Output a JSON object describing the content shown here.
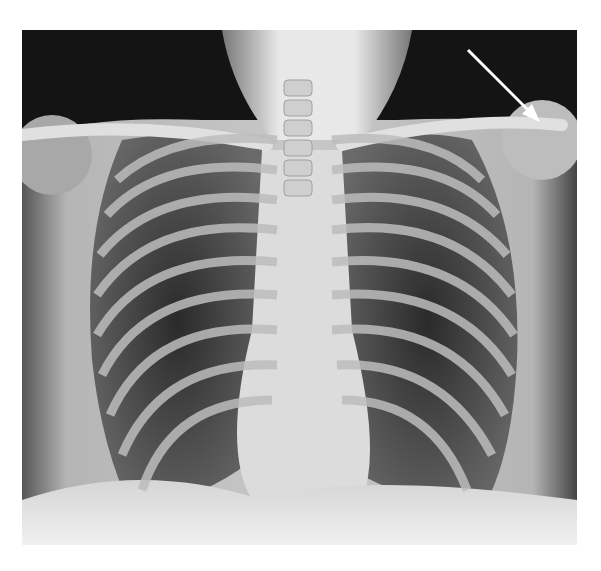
{
  "image": {
    "type": "chest-radiograph",
    "view": "frontal (PA)",
    "annotation": {
      "type": "arrow",
      "color": "#ffffff",
      "from": [
        468,
        50
      ],
      "to": [
        537,
        118
      ],
      "points_to": "left shoulder region (right side of image)"
    },
    "colors": {
      "background": "#ffffff",
      "film_dark": "#111111",
      "soft_tissue": "#9a9a9a",
      "bone": "#e8e8e8",
      "lung": "#3a3a3a"
    }
  }
}
